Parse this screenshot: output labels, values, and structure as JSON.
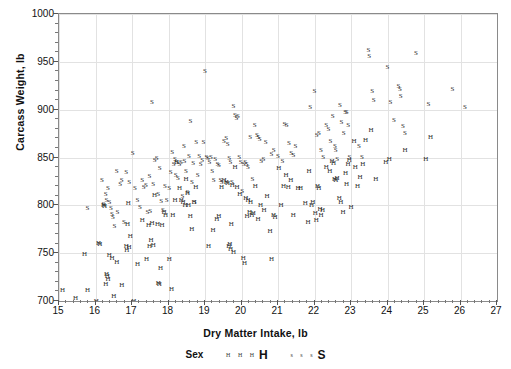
{
  "chart_data": {
    "type": "scatter",
    "title": "",
    "xlabel": "Dry Matter Intake, lb",
    "ylabel": "Carcass Weight, lb",
    "xlim": [
      15,
      27
    ],
    "ylim": [
      700,
      1000
    ],
    "xticks": [
      15,
      16,
      17,
      18,
      19,
      20,
      21,
      22,
      23,
      24,
      25,
      26,
      27
    ],
    "yticks": [
      700,
      750,
      800,
      850,
      900,
      950,
      1000
    ],
    "x_minor_per_major": 5,
    "y_minor_per_major": 5,
    "grid": true,
    "grid_color": "#e2e2e2",
    "frame_color": "#8a8a8a",
    "marker_color": "#2a2a2a",
    "legend": {
      "position": "bottom",
      "title": "Sex",
      "entries": [
        {
          "name": "H",
          "marker": "H",
          "sample": "H H H"
        },
        {
          "name": "S",
          "marker": "S",
          "sample": "s s s"
        }
      ]
    },
    "series": [
      {
        "name": "H",
        "marker": "H",
        "points": [
          [
            15.1,
            711
          ],
          [
            15.45,
            703
          ],
          [
            15.7,
            749
          ],
          [
            15.78,
            712
          ],
          [
            16.02,
            700
          ],
          [
            16.08,
            761
          ],
          [
            16.12,
            760
          ],
          [
            16.22,
            800
          ],
          [
            16.25,
            799
          ],
          [
            16.28,
            718
          ],
          [
            16.3,
            728
          ],
          [
            16.32,
            726
          ],
          [
            16.34,
            723
          ],
          [
            16.38,
            748
          ],
          [
            16.45,
            745
          ],
          [
            16.5,
            705
          ],
          [
            16.58,
            741
          ],
          [
            16.72,
            717
          ],
          [
            16.84,
            757
          ],
          [
            16.86,
            753
          ],
          [
            16.88,
            781
          ],
          [
            16.9,
            802
          ],
          [
            16.92,
            756
          ],
          [
            16.95,
            768
          ],
          [
            17.05,
            700
          ],
          [
            17.15,
            739
          ],
          [
            17.28,
            785
          ],
          [
            17.4,
            744
          ],
          [
            17.45,
            779
          ],
          [
            17.48,
            757
          ],
          [
            17.52,
            764
          ],
          [
            17.55,
            782
          ],
          [
            17.58,
            759
          ],
          [
            17.62,
            811
          ],
          [
            17.7,
            780
          ],
          [
            17.72,
            719
          ],
          [
            17.75,
            718
          ],
          [
            17.78,
            735
          ],
          [
            17.82,
            779
          ],
          [
            17.88,
            793
          ],
          [
            17.92,
            790
          ],
          [
            18.02,
            744
          ],
          [
            18.08,
            713
          ],
          [
            18.12,
            790
          ],
          [
            18.18,
            806
          ],
          [
            18.22,
            845
          ],
          [
            18.3,
            818
          ],
          [
            18.35,
            806
          ],
          [
            18.4,
            804
          ],
          [
            18.45,
            800
          ],
          [
            18.48,
            828
          ],
          [
            18.52,
            813
          ],
          [
            18.55,
            800
          ],
          [
            18.6,
            789
          ],
          [
            18.64,
            775
          ],
          [
            18.7,
            803
          ],
          [
            18.75,
            819
          ],
          [
            19.1,
            757
          ],
          [
            19.22,
            774
          ],
          [
            19.32,
            786
          ],
          [
            19.38,
            789
          ],
          [
            19.45,
            819
          ],
          [
            19.52,
            827
          ],
          [
            19.58,
            824
          ],
          [
            19.62,
            823
          ],
          [
            19.65,
            757
          ],
          [
            19.68,
            760
          ],
          [
            19.7,
            754
          ],
          [
            19.72,
            781
          ],
          [
            19.75,
            821
          ],
          [
            19.78,
            751
          ],
          [
            19.82,
            840
          ],
          [
            19.88,
            819
          ],
          [
            19.95,
            812
          ],
          [
            20.05,
            745
          ],
          [
            20.08,
            740
          ],
          [
            20.12,
            808
          ],
          [
            20.15,
            789
          ],
          [
            20.18,
            806
          ],
          [
            20.22,
            793
          ],
          [
            20.25,
            803
          ],
          [
            20.28,
            790
          ],
          [
            20.32,
            792
          ],
          [
            20.38,
            820
          ],
          [
            20.45,
            786
          ],
          [
            20.52,
            800
          ],
          [
            20.62,
            795
          ],
          [
            20.7,
            810
          ],
          [
            20.78,
            773
          ],
          [
            20.82,
            744
          ],
          [
            20.88,
            790
          ],
          [
            20.92,
            788
          ],
          [
            21.02,
            839
          ],
          [
            21.08,
            800
          ],
          [
            21.15,
            820
          ],
          [
            21.22,
            832
          ],
          [
            21.28,
            819
          ],
          [
            21.35,
            826
          ],
          [
            21.42,
            790
          ],
          [
            21.55,
            818
          ],
          [
            21.62,
            818
          ],
          [
            21.75,
            802
          ],
          [
            21.82,
            783
          ],
          [
            21.85,
            836
          ],
          [
            21.92,
            800
          ],
          [
            21.95,
            804
          ],
          [
            22.02,
            792
          ],
          [
            22.05,
            785
          ],
          [
            22.08,
            820
          ],
          [
            22.12,
            818
          ],
          [
            22.15,
            796
          ],
          [
            22.18,
            790
          ],
          [
            22.22,
            795
          ],
          [
            22.32,
            840
          ],
          [
            22.42,
            836
          ],
          [
            22.48,
            846
          ],
          [
            22.52,
            844
          ],
          [
            22.55,
            828
          ],
          [
            22.58,
            826
          ],
          [
            22.62,
            829
          ],
          [
            22.68,
            808
          ],
          [
            22.72,
            803
          ],
          [
            22.78,
            793
          ],
          [
            22.85,
            834
          ],
          [
            22.88,
            822
          ],
          [
            22.92,
            843
          ],
          [
            22.95,
            847
          ],
          [
            23.0,
            798
          ],
          [
            23.08,
            867
          ],
          [
            23.12,
            840
          ],
          [
            23.18,
            820
          ],
          [
            23.25,
            830
          ],
          [
            23.32,
            843
          ],
          [
            23.4,
            868
          ],
          [
            23.55,
            879
          ],
          [
            23.68,
            828
          ],
          [
            23.95,
            845
          ],
          [
            24.05,
            848
          ],
          [
            24.48,
            858
          ],
          [
            25.05,
            848
          ],
          [
            25.18,
            871
          ]
        ]
      },
      {
        "name": "S",
        "marker": "S",
        "points": [
          [
            15.78,
            797
          ],
          [
            16.18,
            826
          ],
          [
            16.22,
            801
          ],
          [
            16.28,
            812
          ],
          [
            16.3,
            806
          ],
          [
            16.34,
            818
          ],
          [
            16.38,
            803
          ],
          [
            16.42,
            797
          ],
          [
            16.45,
            791
          ],
          [
            16.48,
            788
          ],
          [
            16.52,
            778
          ],
          [
            16.58,
            836
          ],
          [
            16.6,
            793
          ],
          [
            16.68,
            822
          ],
          [
            16.72,
            827
          ],
          [
            16.78,
            783
          ],
          [
            16.84,
            835
          ],
          [
            16.92,
            824
          ],
          [
            17.02,
            855
          ],
          [
            17.08,
            818
          ],
          [
            17.15,
            806
          ],
          [
            17.22,
            798
          ],
          [
            17.28,
            827
          ],
          [
            17.32,
            819
          ],
          [
            17.38,
            821
          ],
          [
            17.42,
            793
          ],
          [
            17.48,
            831
          ],
          [
            17.5,
            794
          ],
          [
            17.55,
            908
          ],
          [
            17.58,
            822
          ],
          [
            17.62,
            847
          ],
          [
            17.68,
            849
          ],
          [
            17.72,
            812
          ],
          [
            17.76,
            839
          ],
          [
            17.8,
            805
          ],
          [
            17.85,
            795
          ],
          [
            17.9,
            820
          ],
          [
            17.95,
            806
          ],
          [
            18.02,
            818
          ],
          [
            18.06,
            835
          ],
          [
            18.1,
            856
          ],
          [
            18.14,
            843
          ],
          [
            18.18,
            848
          ],
          [
            18.2,
            832
          ],
          [
            18.22,
            845
          ],
          [
            18.26,
            829
          ],
          [
            18.3,
            843
          ],
          [
            18.34,
            845
          ],
          [
            18.38,
            810
          ],
          [
            18.42,
            862
          ],
          [
            18.44,
            846
          ],
          [
            18.48,
            836
          ],
          [
            18.52,
            814
          ],
          [
            18.56,
            852
          ],
          [
            18.6,
            888
          ],
          [
            18.64,
            824
          ],
          [
            18.68,
            844
          ],
          [
            18.72,
            804
          ],
          [
            18.76,
            866
          ],
          [
            18.8,
            832
          ],
          [
            18.84,
            852
          ],
          [
            18.88,
            843
          ],
          [
            18.92,
            847
          ],
          [
            18.96,
            866
          ],
          [
            19.0,
            940
          ],
          [
            19.04,
            851
          ],
          [
            19.08,
            849
          ],
          [
            19.12,
            845
          ],
          [
            19.16,
            851
          ],
          [
            19.2,
            836
          ],
          [
            19.24,
            827
          ],
          [
            19.28,
            848
          ],
          [
            19.34,
            843
          ],
          [
            19.38,
            842
          ],
          [
            19.42,
            826
          ],
          [
            19.46,
            824
          ],
          [
            19.52,
            867
          ],
          [
            19.58,
            870
          ],
          [
            19.62,
            864
          ],
          [
            19.66,
            850
          ],
          [
            19.7,
            845
          ],
          [
            19.74,
            824
          ],
          [
            19.78,
            904
          ],
          [
            19.82,
            894
          ],
          [
            19.86,
            891
          ],
          [
            19.9,
            893
          ],
          [
            19.94,
            851
          ],
          [
            19.98,
            845
          ],
          [
            20.02,
            815
          ],
          [
            20.06,
            843
          ],
          [
            20.1,
            845
          ],
          [
            20.14,
            843
          ],
          [
            20.18,
            840
          ],
          [
            20.24,
            871
          ],
          [
            20.3,
            828
          ],
          [
            20.36,
            884
          ],
          [
            20.42,
            873
          ],
          [
            20.46,
            871
          ],
          [
            20.5,
            869
          ],
          [
            20.54,
            846
          ],
          [
            20.6,
            848
          ],
          [
            20.66,
            866
          ],
          [
            20.82,
            854
          ],
          [
            20.88,
            858
          ],
          [
            21.0,
            852
          ],
          [
            21.12,
            846
          ],
          [
            21.18,
            885
          ],
          [
            21.24,
            884
          ],
          [
            21.3,
            865
          ],
          [
            21.36,
            855
          ],
          [
            21.42,
            853
          ],
          [
            21.48,
            862
          ],
          [
            21.88,
            903
          ],
          [
            22.0,
            919
          ],
          [
            22.06,
            874
          ],
          [
            22.12,
            876
          ],
          [
            22.18,
            858
          ],
          [
            22.24,
            851
          ],
          [
            22.32,
            884
          ],
          [
            22.38,
            880
          ],
          [
            22.44,
            867
          ],
          [
            22.5,
            893
          ],
          [
            22.56,
            862
          ],
          [
            22.58,
            858
          ],
          [
            22.62,
            848
          ],
          [
            22.7,
            905
          ],
          [
            22.74,
            887
          ],
          [
            22.8,
            876
          ],
          [
            22.84,
            898
          ],
          [
            22.88,
            898
          ],
          [
            22.92,
            884
          ],
          [
            22.96,
            851
          ],
          [
            23.22,
            862
          ],
          [
            23.3,
            851
          ],
          [
            23.48,
            962
          ],
          [
            23.5,
            956
          ],
          [
            23.58,
            919
          ],
          [
            23.62,
            910
          ],
          [
            24.0,
            945
          ],
          [
            24.08,
            908
          ],
          [
            24.18,
            889
          ],
          [
            24.3,
            925
          ],
          [
            24.34,
            922
          ],
          [
            24.36,
            914
          ],
          [
            24.42,
            883
          ],
          [
            24.48,
            876
          ],
          [
            24.78,
            959
          ],
          [
            25.12,
            906
          ],
          [
            25.78,
            922
          ],
          [
            26.12,
            903
          ]
        ]
      }
    ]
  },
  "axis": {
    "y_tick_labels": [
      "1000",
      "950",
      "900",
      "850",
      "800",
      "750",
      "700"
    ],
    "x_tick_labels": [
      "15",
      "16",
      "17",
      "18",
      "19",
      "20",
      "21",
      "22",
      "23",
      "24",
      "25",
      "26",
      "27"
    ],
    "y_title": "Carcass Weight, lb",
    "x_title": "Dry Matter Intake, lb"
  },
  "legend_ui": {
    "title": "Sex",
    "h_small": "H H H",
    "h_big": "H",
    "s_small": "s s s",
    "s_big": "S"
  }
}
